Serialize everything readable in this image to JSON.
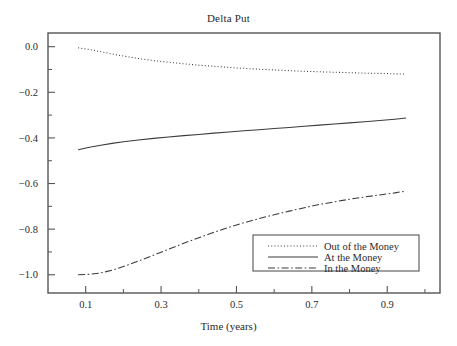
{
  "chart_data": {
    "type": "line",
    "title": "Delta Put",
    "xlabel": "Time (years)",
    "ylabel": "",
    "xlim": [
      0.0,
      1.04
    ],
    "ylim": [
      -1.08,
      0.06
    ],
    "grid": false,
    "legend_position": "lower right",
    "x_ticks_major": [
      0.1,
      0.3,
      0.5,
      0.7,
      0.9
    ],
    "x_ticks_major_labels": [
      "0.1",
      "0.3",
      "0.5",
      "0.7",
      "0.9"
    ],
    "x_ticks_minor": [
      0.2,
      0.4,
      0.6,
      0.8,
      1.0
    ],
    "y_ticks_major": [
      0.0,
      -0.2,
      -0.4,
      -0.6,
      -0.8,
      -1.0
    ],
    "y_ticks_major_labels": [
      "0.0",
      "−0.2",
      "−0.4",
      "−0.6",
      "−0.8",
      "−1.0"
    ],
    "y_ticks_minor": [
      -0.1,
      -0.3,
      -0.5,
      -0.7,
      -0.9
    ],
    "x": [
      0.08,
      0.11,
      0.14,
      0.17,
      0.2,
      0.24,
      0.28,
      0.32,
      0.36,
      0.4,
      0.44,
      0.48,
      0.52,
      0.56,
      0.6,
      0.64,
      0.68,
      0.72,
      0.76,
      0.8,
      0.84,
      0.88,
      0.92,
      0.95
    ],
    "series": [
      {
        "name": "Out of the Money",
        "style": "dotted",
        "values": [
          -0.005,
          -0.012,
          -0.022,
          -0.032,
          -0.041,
          -0.052,
          -0.061,
          -0.068,
          -0.075,
          -0.081,
          -0.086,
          -0.091,
          -0.095,
          -0.099,
          -0.102,
          -0.105,
          -0.108,
          -0.11,
          -0.112,
          -0.114,
          -0.116,
          -0.117,
          -0.119,
          -0.12
        ]
      },
      {
        "name": "At the Money",
        "style": "solid",
        "values": [
          -0.452,
          -0.441,
          -0.432,
          -0.424,
          -0.417,
          -0.409,
          -0.402,
          -0.396,
          -0.39,
          -0.385,
          -0.379,
          -0.374,
          -0.369,
          -0.364,
          -0.359,
          -0.354,
          -0.349,
          -0.344,
          -0.339,
          -0.334,
          -0.329,
          -0.324,
          -0.318,
          -0.313
        ]
      },
      {
        "name": "In the Money",
        "style": "dashdot",
        "values": [
          -1.0,
          -0.998,
          -0.992,
          -0.98,
          -0.964,
          -0.94,
          -0.914,
          -0.888,
          -0.862,
          -0.838,
          -0.814,
          -0.792,
          -0.772,
          -0.754,
          -0.737,
          -0.721,
          -0.706,
          -0.692,
          -0.68,
          -0.669,
          -0.659,
          -0.65,
          -0.641,
          -0.633
        ]
      }
    ]
  },
  "legend": {
    "items": [
      {
        "label": "Out of the Money",
        "style": "dotted"
      },
      {
        "label": "At the Money",
        "style": "solid"
      },
      {
        "label": "In the Money",
        "style": "dashdot"
      }
    ]
  },
  "colors": {
    "axis": "#555555",
    "line": "#3a3a3a",
    "text": "#2a2a2a",
    "background": "#ffffff"
  }
}
